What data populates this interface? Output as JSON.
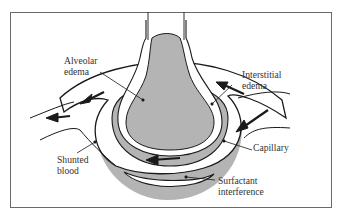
{
  "diagram": {
    "type": "anatomical illustration",
    "colors": {
      "fill_gray": "#b4b4b4",
      "outline": "#1a1a1a",
      "frame": "#6a6a6a",
      "background": "#ffffff"
    },
    "labels": {
      "alveolar_edema": {
        "line1": "Alveolar",
        "line2": "edema"
      },
      "interstitial_edema": {
        "line1": "Interstitial",
        "line2": "edema"
      },
      "capillary": {
        "line1": "Capillary"
      },
      "shunted_blood": {
        "line1": "Shunted",
        "line2": "blood"
      },
      "surfactant_interference": {
        "line1": "Surfactant",
        "line2": "interference"
      }
    }
  }
}
